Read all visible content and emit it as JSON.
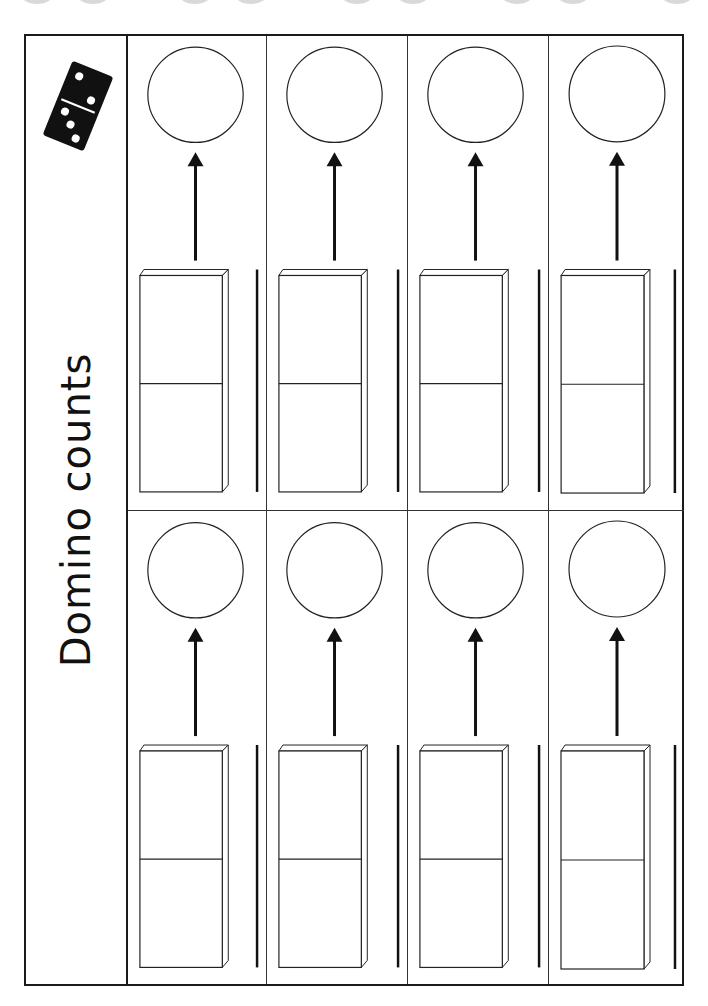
{
  "worksheet": {
    "title": "Domino counts",
    "icon": {
      "name": "domino-icon",
      "top_dots": 2,
      "bottom_dots": 3,
      "color": "#111111"
    },
    "sections": [
      {
        "id": "top",
        "cells": [
          {
            "answer": "",
            "count_line": ""
          },
          {
            "answer": "",
            "count_line": ""
          },
          {
            "answer": "",
            "count_line": ""
          },
          {
            "answer": "",
            "count_line": ""
          }
        ]
      },
      {
        "id": "bottom",
        "cells": [
          {
            "answer": "",
            "count_line": ""
          },
          {
            "answer": "",
            "count_line": ""
          },
          {
            "answer": "",
            "count_line": ""
          },
          {
            "answer": "",
            "count_line": ""
          }
        ]
      }
    ],
    "colors": {
      "line": "#1a1a1a",
      "hole": "#d9d9d9",
      "paper": "#ffffff"
    }
  }
}
